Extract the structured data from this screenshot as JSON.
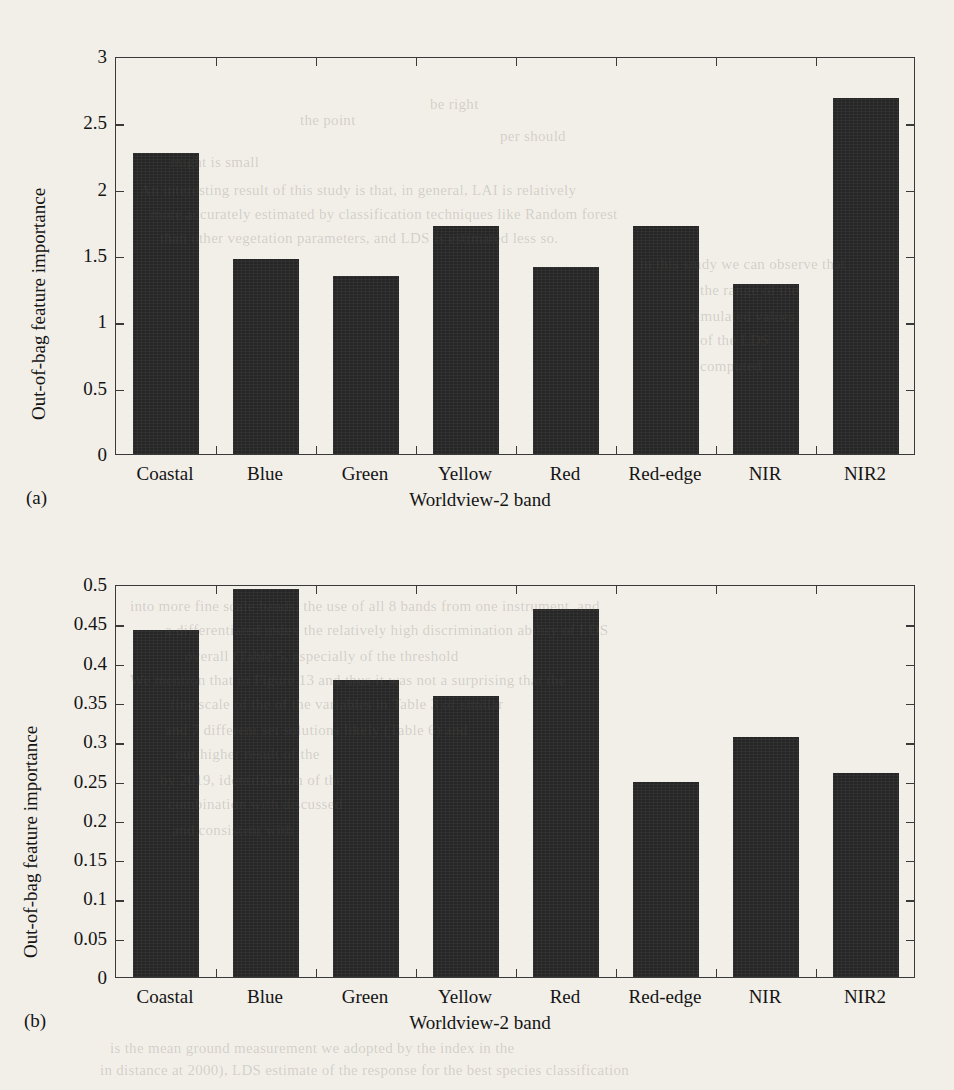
{
  "page": {
    "background_color": "#f2efe9",
    "bar_color": "#262626",
    "axis_color": "#3a3a3a"
  },
  "bleed_through_text": [
    {
      "text": "be right",
      "x": 430,
      "y": 96
    },
    {
      "text": "the point",
      "x": 300,
      "y": 112
    },
    {
      "text": "per should",
      "x": 500,
      "y": 128
    },
    {
      "text": "might is small",
      "x": 170,
      "y": 154
    },
    {
      "text": "An interesting result of this study is that, in general, LAI is relatively",
      "x": 140,
      "y": 182
    },
    {
      "text": "more accurately estimated by classification techniques like Random forest",
      "x": 150,
      "y": 206
    },
    {
      "text": "than other vegetation parameters, and LDS is estimated less so.",
      "x": 160,
      "y": 230
    },
    {
      "text": "in this study we can observe that",
      "x": 640,
      "y": 256
    },
    {
      "text": "the range of the",
      "x": 700,
      "y": 282
    },
    {
      "text": "simulated values",
      "x": 690,
      "y": 308
    },
    {
      "text": "of the LDS",
      "x": 700,
      "y": 332
    },
    {
      "text": "computed",
      "x": 700,
      "y": 358
    },
    {
      "text": "into more fine scale bands, the use of all 8 bands from one instrument, and",
      "x": 130,
      "y": 598
    },
    {
      "text": "a differentiated index the relatively high discrimination ability of LDS",
      "x": 165,
      "y": 622
    },
    {
      "text": "overall (Table 5, especially of the threshold",
      "x": 185,
      "y": 648
    },
    {
      "text": "We mention that in Figure 13 and thus it was not a surprising that the",
      "x": 130,
      "y": 672
    },
    {
      "text": "fine scale of the of the variables in Table 3 or similar",
      "x": 170,
      "y": 696
    },
    {
      "text": "and 7 different set solutions likely (Table 6) and",
      "x": 165,
      "y": 722
    },
    {
      "text": "our higher result of the",
      "x": 175,
      "y": 746
    },
    {
      "text": "by 2019, identification of the",
      "x": 160,
      "y": 772
    },
    {
      "text": "combination with discussed",
      "x": 168,
      "y": 796
    },
    {
      "text": "and consistent with",
      "x": 172,
      "y": 822
    },
    {
      "text": "in distance at 2000), LDS estimate of the response for the best species classification",
      "x": 100,
      "y": 1062
    },
    {
      "text": "is the mean ground measurement we adopted by the index in the",
      "x": 110,
      "y": 1040
    }
  ],
  "chart_data": [
    {
      "panel": "(a)",
      "type": "bar",
      "title": "",
      "xlabel": "Worldview-2 band",
      "ylabel": "Out-of-bag feature importance",
      "categories": [
        "Coastal",
        "Blue",
        "Green",
        "Yellow",
        "Red",
        "Red-edge",
        "NIR",
        "NIR2"
      ],
      "values": [
        2.27,
        1.47,
        1.34,
        1.72,
        1.41,
        1.72,
        1.28,
        2.68
      ],
      "ylim": [
        0,
        3
      ],
      "yticks": [
        0,
        0.5,
        1,
        1.5,
        2,
        2.5,
        3
      ],
      "ytick_labels": [
        "0",
        "0.5",
        "1",
        "1.5",
        "2",
        "2.5",
        "3"
      ],
      "grid": false,
      "legend": "none"
    },
    {
      "panel": "(b)",
      "type": "bar",
      "title": "",
      "xlabel": "Worldview-2 band",
      "ylabel": "Out-of-bag feature importance",
      "categories": [
        "Coastal",
        "Blue",
        "Green",
        "Yellow",
        "Red",
        "Red-edge",
        "NIR",
        "NIR2"
      ],
      "values": [
        0.441,
        0.494,
        0.378,
        0.358,
        0.468,
        0.248,
        0.305,
        0.259
      ],
      "ylim": [
        0,
        0.5
      ],
      "yticks": [
        0,
        0.05,
        0.1,
        0.15,
        0.2,
        0.25,
        0.3,
        0.35,
        0.4,
        0.45,
        0.5
      ],
      "ytick_labels": [
        "0",
        "0.05",
        "0.1",
        "0.15",
        "0.2",
        "0.25",
        "0.3",
        "0.35",
        "0.4",
        "0.45",
        "0.5"
      ],
      "grid": false,
      "legend": "none"
    }
  ]
}
